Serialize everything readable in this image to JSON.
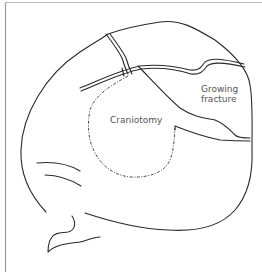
{
  "figure": {
    "type": "anatomical line drawing",
    "labels": {
      "craniotomy": "Craniotomy",
      "growing_fracture_line1": "Growing",
      "growing_fracture_line2": "fracture"
    },
    "colors": {
      "line": "#2a2a2a",
      "label": "#555555",
      "frame": "#9a9a9a",
      "background": "#ffffff"
    }
  }
}
